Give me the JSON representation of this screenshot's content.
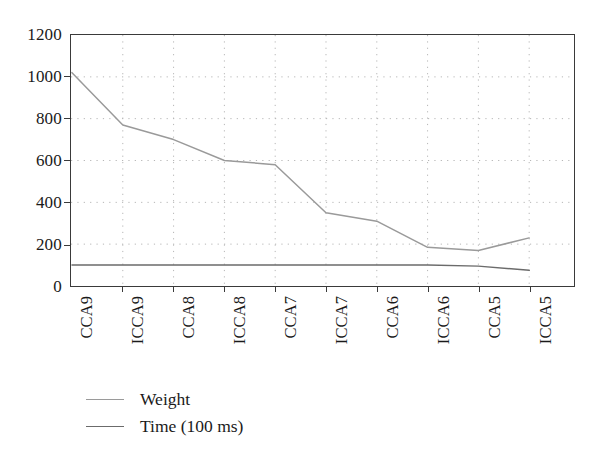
{
  "chart_data": {
    "type": "line",
    "title": "",
    "xlabel": "",
    "ylabel": "",
    "categories": [
      "CCA9",
      "ICCA9",
      "CCA8",
      "ICCA8",
      "CCA7",
      "ICCA7",
      "CCA6",
      "ICCA6",
      "CCA5",
      "ICCA5"
    ],
    "series": [
      {
        "name": "Weight",
        "color": "#9a9a9a",
        "values": [
          1020,
          770,
          700,
          600,
          580,
          350,
          310,
          185,
          170,
          230
        ]
      },
      {
        "name": "Time (100 ms)",
        "color": "#6b6b6b",
        "values": [
          100,
          100,
          100,
          100,
          100,
          100,
          100,
          100,
          95,
          75
        ]
      }
    ],
    "ylim": [
      0,
      1200
    ],
    "ytick_labels": [
      "0",
      "200",
      "400",
      "600",
      "800",
      "1000",
      "1200"
    ],
    "ytick_values": [
      0,
      200,
      400,
      600,
      800,
      1000,
      1200
    ],
    "grid": true,
    "grid_style": "dotted",
    "legend_position": "below-left"
  },
  "legend": {
    "entries": [
      {
        "label": "Weight"
      },
      {
        "label": "Time (100 ms)"
      }
    ]
  },
  "axis": {
    "y_labels": [
      "1200",
      "1000",
      "800",
      "600",
      "400",
      "200",
      "0"
    ],
    "x_labels": [
      "CCA9",
      "ICCA9",
      "CCA8",
      "ICCA8",
      "CCA7",
      "ICCA7",
      "CCA6",
      "ICCA6",
      "CCA5",
      "ICCA5"
    ]
  },
  "colors": {
    "weight_line": "#9a9a9a",
    "time_line": "#6b6b6b",
    "axis": "#3a3a3a",
    "grid": "#b5b5b5",
    "background": "#ffffff"
  }
}
